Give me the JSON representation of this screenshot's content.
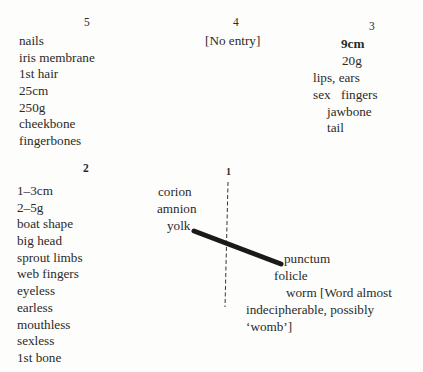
{
  "stages": {
    "s5": {
      "number": "5",
      "items": [
        "nails",
        "iris membrane",
        "1st hair",
        "25cm",
        "250g",
        "cheekbone",
        "fingerbones"
      ]
    },
    "s4": {
      "number": "4",
      "items": [
        "[No entry]"
      ]
    },
    "s3": {
      "number": "3",
      "size": "9cm",
      "weight": "20g",
      "items_a": "lips, ears",
      "items_b_left": "sex",
      "items_b_right": "fingers",
      "items_c": "jawbone",
      "items_d": "tail"
    },
    "s2": {
      "number": "2",
      "items": [
        "1–3cm",
        "2–5g",
        "boat shape",
        "big head",
        "sprout limbs",
        "web fingers",
        "eyeless",
        "earless",
        "mouthless",
        "sexless",
        "1st bone"
      ]
    },
    "s1": {
      "number": "1",
      "left_items": [
        "corion",
        "amnion",
        "yolk"
      ],
      "right_items": [
        "punctum",
        "folicle"
      ],
      "note_line1": "worm [Word almost",
      "note_line2": "indecipherable, possibly",
      "note_line3": "‘womb’]"
    }
  }
}
